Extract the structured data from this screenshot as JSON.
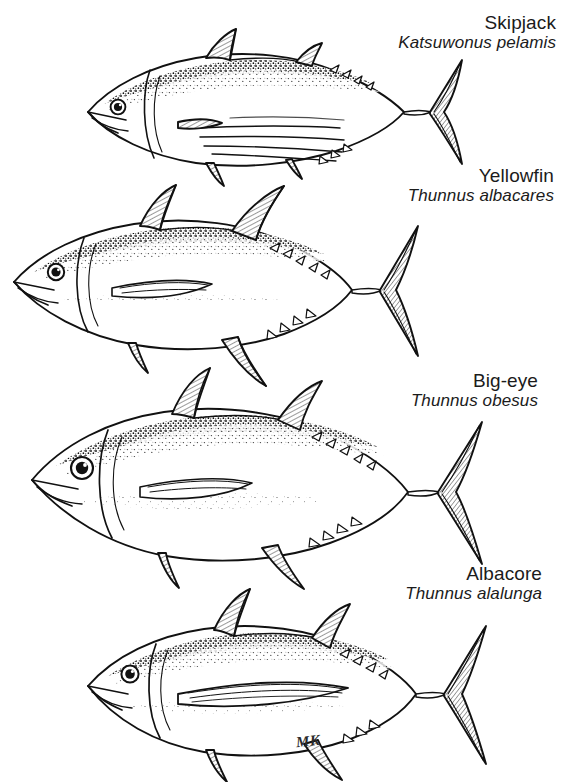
{
  "plate": {
    "title": "Tuna species identification plate",
    "background_color": "#ffffff",
    "ink_color": "#111111",
    "artist_signature": "MK"
  },
  "species": [
    {
      "id": "skipjack",
      "common_name": "Skipjack",
      "scientific_name": "Katsuwonus pelamis",
      "label_align": "right",
      "features": [
        "horizontal flank stripes",
        "stippled dark back",
        "small pectoral fin",
        "lunate caudal fin",
        "dorsal and ventral finlets"
      ]
    },
    {
      "id": "yellowfin",
      "common_name": "Yellowfin",
      "scientific_name": "Thunnus albacares",
      "label_align": "right",
      "features": [
        "tall first dorsal fin",
        "elongated sickle second dorsal and anal fins",
        "long pectoral fin",
        "stippled back"
      ]
    },
    {
      "id": "bigeye",
      "common_name": "Big-eye",
      "scientific_name": "Thunnus obesus",
      "label_align": "right",
      "features": [
        "very large eye",
        "deep stout body",
        "heavy stippling on dorsum",
        "broad lunate tail"
      ]
    },
    {
      "id": "albacore",
      "common_name": "Albacore",
      "scientific_name": "Thunnus alalunga",
      "label_align": "right",
      "features": [
        "extremely long pectoral fin reaching past mid-body",
        "stippled back",
        "lunate caudal fin"
      ]
    }
  ]
}
